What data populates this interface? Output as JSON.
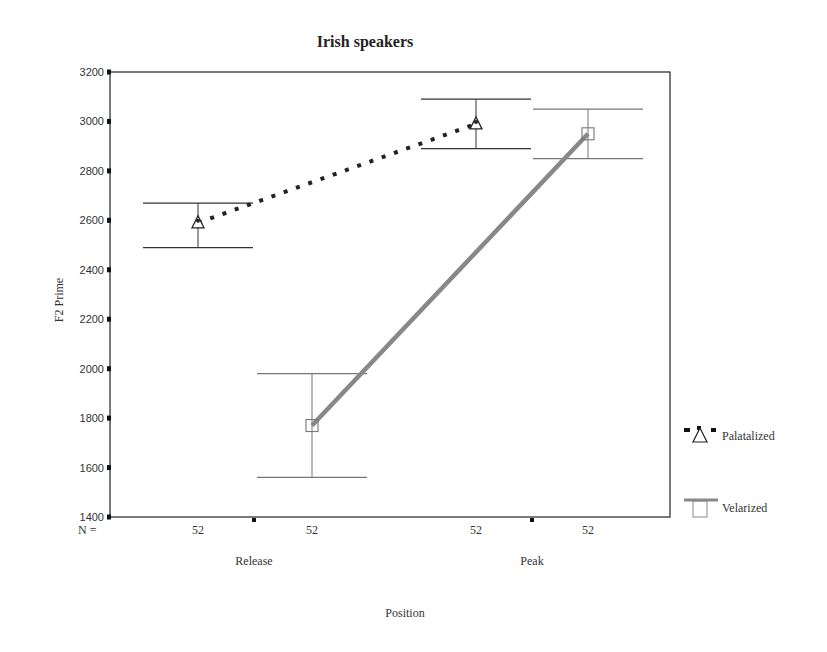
{
  "chart_data": {
    "type": "line",
    "title": "Irish speakers",
    "xlabel": "Position",
    "ylabel": "F2 Prime",
    "categories": [
      "Release",
      "Peak"
    ],
    "ylim": [
      1400,
      3200
    ],
    "yticks": [
      1400,
      1600,
      1800,
      2000,
      2200,
      2400,
      2600,
      2800,
      3000,
      3200
    ],
    "grid": false,
    "legend_position": "right",
    "n_label": "N =",
    "n_counts": [
      "52",
      "52",
      "52",
      "52"
    ],
    "series": [
      {
        "name": "Palatalized",
        "marker": "triangle",
        "line_style": "dotted",
        "color": "#222222",
        "values": [
          2590,
          2990
        ],
        "error_low": [
          2490,
          2890
        ],
        "error_high": [
          2670,
          3090
        ]
      },
      {
        "name": "Velarized",
        "marker": "square",
        "line_style": "solid",
        "color": "#888888",
        "values": [
          1770,
          2950
        ],
        "error_low": [
          1560,
          2850
        ],
        "error_high": [
          1980,
          3050
        ]
      }
    ]
  }
}
